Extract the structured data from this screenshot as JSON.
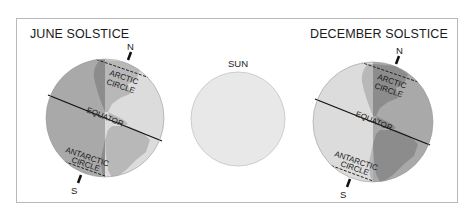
{
  "panels": {
    "june": {
      "title": "JUNE SOLSTICE",
      "north_label": "N",
      "south_label": "S",
      "arctic_label_1": "ARCTIC",
      "arctic_label_2": "CIRCLE",
      "equator_label": "EQUATOR",
      "antarctic_label_1": "ANTARCTIC",
      "antarctic_label_2": "CIRCLE",
      "lit_side": "right"
    },
    "sun": {
      "label": "SUN"
    },
    "december": {
      "title": "DECEMBER SOLSTICE",
      "north_label": "N",
      "south_label": "S",
      "arctic_label_1": "ARCTIC",
      "arctic_label_2": "CIRCLE",
      "equator_label": "EQUATOR",
      "antarctic_label_1": "ANTARCTIC",
      "antarctic_label_2": "CIRCLE",
      "lit_side": "left"
    }
  },
  "colors": {
    "night_ocean": "#a9a9a9",
    "night_land": "#8c8c8c",
    "day_ocean": "#dcdcdc",
    "day_land": "#b8b8b8",
    "sun_fill": "#e8e8e8",
    "sun_stroke": "#c4c4c4",
    "frame": "#b8b8b8"
  }
}
